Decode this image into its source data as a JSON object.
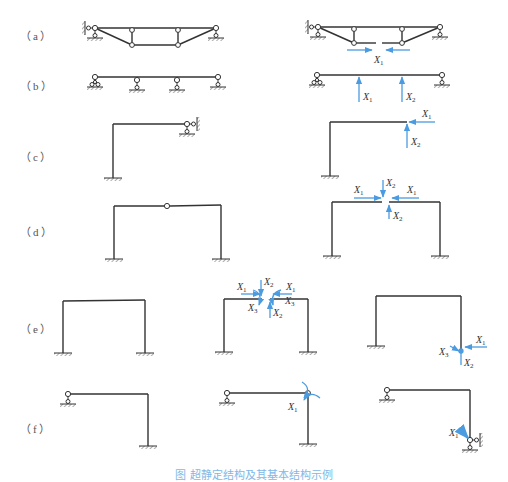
{
  "figure": {
    "type": "structural-mechanics-diagram",
    "colors": {
      "member": "#333333",
      "redundant_arrow": "#4a9be0",
      "label": "#333333",
      "caption": "#7fb8e6"
    },
    "rows": [
      {
        "id": "a",
        "label": "（a）",
        "panels": [
          {
            "name": "original-truss-beam",
            "description": "trussed beam, pin-roller supports, two posts with hinges"
          },
          {
            "name": "basic-structure",
            "redundants": [
              "X1"
            ],
            "labels": {
              "x1": "X",
              "x1_sub": "1"
            }
          }
        ]
      },
      {
        "id": "b",
        "label": "（b）",
        "panels": [
          {
            "name": "original-continuous-beam",
            "description": "beam on 4 supports"
          },
          {
            "name": "basic-structure",
            "redundants": [
              "X1",
              "X2"
            ],
            "labels": {
              "x1": "X",
              "x1_sub": "1",
              "x2": "X",
              "x2_sub": "2"
            }
          }
        ]
      },
      {
        "id": "c",
        "label": "（c）",
        "panels": [
          {
            "name": "original-l-frame",
            "description": "L-frame fixed base, pinned support at right end"
          },
          {
            "name": "basic-structure",
            "redundants": [
              "X1",
              "X2"
            ],
            "labels": {
              "x1": "X",
              "x1_sub": "1",
              "x2": "X",
              "x2_sub": "2"
            }
          }
        ]
      },
      {
        "id": "d",
        "label": "（d）",
        "panels": [
          {
            "name": "original-three-hinged-frame",
            "description": "portal frame with hinge at top center"
          },
          {
            "name": "basic-structure",
            "redundants": [
              "X1",
              "X2"
            ],
            "labels": {
              "x1": "X",
              "x1_sub": "1",
              "x2": "X",
              "x2_sub": "2"
            }
          }
        ]
      },
      {
        "id": "e",
        "label": "（e）",
        "panels": [
          {
            "name": "original-fixed-portal-frame",
            "description": "portal frame with both bases fixed"
          },
          {
            "name": "basic-structure-cut-at-top",
            "redundants": [
              "X1",
              "X2",
              "X3"
            ],
            "labels": {
              "x1": "X",
              "x1_sub": "1",
              "x2": "X",
              "x2_sub": "2",
              "x3": "X",
              "x3_sub": "3"
            }
          },
          {
            "name": "basic-structure-released-base",
            "redundants": [
              "X1",
              "X2",
              "X3"
            ],
            "labels": {
              "x1": "X",
              "x1_sub": "1",
              "x2": "X",
              "x2_sub": "2",
              "x3": "X",
              "x3_sub": "3"
            }
          }
        ]
      },
      {
        "id": "f",
        "label": "（f）",
        "panels": [
          {
            "name": "original-frame",
            "description": "frame with pin-roller left support, fixed base right column"
          },
          {
            "name": "basic-structure-hinge-at-corner",
            "redundants": [
              "X1"
            ],
            "labels": {
              "x1": "X",
              "x1_sub": "1"
            }
          },
          {
            "name": "basic-structure-hinged-base",
            "redundants": [
              "X1"
            ],
            "labels": {
              "x1": "X",
              "x1_sub": "1"
            }
          }
        ]
      }
    ],
    "caption": "图  超静定结构及其基本结构示例"
  }
}
